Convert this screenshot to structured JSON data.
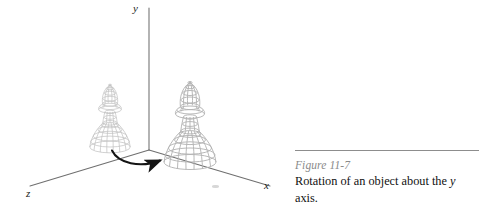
{
  "figure": {
    "axes": {
      "y_label": "y",
      "x_label": "x",
      "z_label": "z",
      "axis_color": "#6f6f6f",
      "origin": {
        "x": 149,
        "y": 150
      },
      "y_axis_end": {
        "x": 149,
        "y": 8
      },
      "x_axis_end": {
        "x": 270,
        "y": 186
      },
      "z_axis_end": {
        "x": 30,
        "y": 186
      }
    },
    "rotation_arrow": {
      "name": "rotation-arrow",
      "color": "#141414",
      "direction": "clockwise-about-y",
      "start": {
        "x": 112,
        "y": 152
      },
      "end": {
        "x": 167,
        "y": 158
      }
    },
    "objects": [
      {
        "name": "chess-piece-original",
        "label": "bishop wireframe (original position)",
        "center_x": 110,
        "base_y": 147,
        "top_y": 68,
        "scale": 0.78,
        "stroke": "#bdbdbd"
      },
      {
        "name": "chess-piece-rotated",
        "label": "bishop wireframe (rotated position)",
        "center_x": 190,
        "base_y": 162,
        "top_y": 62,
        "scale": 1.0,
        "stroke": "#b2b2b2"
      }
    ]
  },
  "caption": {
    "rule_color": "#8d8d8d",
    "figure_number": "Figure 11-7",
    "line1": "Rotation of an object about the",
    "line2_italic": "y",
    "line2_rest": " axis."
  }
}
